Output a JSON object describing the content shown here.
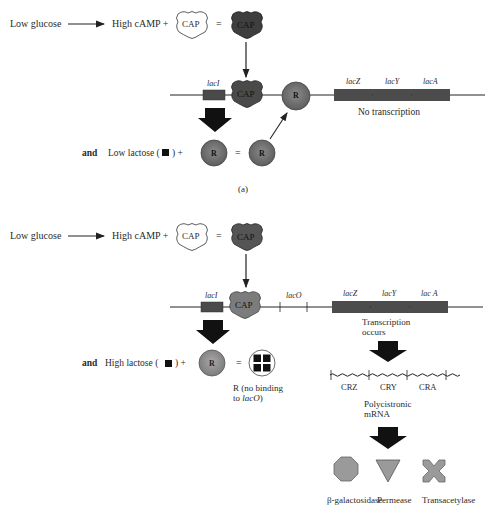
{
  "panel_a": {
    "label": "(a)",
    "row1": {
      "low_glucose": "Low glucose",
      "high_camp": "High cAMP +",
      "cap_inactive": "CAP",
      "equals": "=",
      "cap_active": "CAP"
    },
    "dna": {
      "lacI": "lacI",
      "cap_bound": "CAP",
      "repressor_bound": "R",
      "lacZ": "lacZ",
      "lacY": "lacY",
      "lacA": "lacA",
      "status": "No transcription"
    },
    "row2": {
      "and": "and",
      "lactose": "Low lactose (",
      "lactose_close": ") +",
      "repressor": "R",
      "equals": "=",
      "repressor_result": "R"
    }
  },
  "panel_b": {
    "row1": {
      "low_glucose": "Low glucose",
      "high_camp": "High cAMP +",
      "cap_inactive": "CAP",
      "equals": "=",
      "cap_active": "CAP"
    },
    "dna": {
      "lacI": "lacI",
      "cap_bound": "CAP",
      "lacO": "lacO",
      "lacZ": "lacZ",
      "lacY": "lacY",
      "lacA": "lac A",
      "status_line1": "Transcription",
      "status_line2": "occurs"
    },
    "row2": {
      "and": "and",
      "lactose": "High lactose (",
      "lactose_close": ") +",
      "repressor": "R",
      "equals": "=",
      "result_line1": "R (no binding",
      "result_line2_prefix": "to ",
      "result_line2_italic": "lacO",
      "result_line2_suffix": ")"
    },
    "mrna": {
      "segments": [
        "CRZ",
        "CRY",
        "CRA"
      ],
      "label_line1": "Polycistronic",
      "label_line2": "mRNA"
    },
    "proteins": [
      {
        "name": "β-galactosidase",
        "shape": "octagon"
      },
      {
        "name": "Permease",
        "shape": "triangle"
      },
      {
        "name": "Transacetylase",
        "shape": "x-cross"
      }
    ]
  },
  "colors": {
    "dark_fill": "#4a4a4a",
    "mid_fill": "#7a7a7a",
    "light_fill": "#9a9a9a",
    "line": "#222222",
    "arrow": "#111111"
  }
}
